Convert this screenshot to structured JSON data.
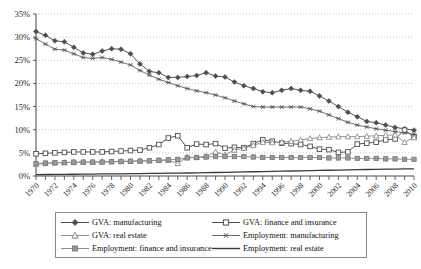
{
  "chart_data": {
    "type": "line",
    "title": "",
    "xlabel": "",
    "ylabel": "",
    "ylim": [
      0,
      35
    ],
    "yticks": [
      "0%",
      "5%",
      "10%",
      "15%",
      "20%",
      "25%",
      "30%",
      "35%"
    ],
    "ytick_values": [
      0,
      5,
      10,
      15,
      20,
      25,
      30,
      35
    ],
    "grid": true,
    "grid_style": "dotted horizontal",
    "legend_position": "bottom",
    "legend_columns": 2,
    "x": [
      1970,
      1971,
      1972,
      1973,
      1974,
      1975,
      1976,
      1977,
      1978,
      1979,
      1980,
      1981,
      1982,
      1983,
      1984,
      1985,
      1986,
      1987,
      1988,
      1989,
      1990,
      1991,
      1992,
      1993,
      1994,
      1995,
      1996,
      1997,
      1998,
      1999,
      2000,
      2001,
      2002,
      2003,
      2004,
      2005,
      2006,
      2007,
      2008,
      2009,
      2010
    ],
    "xtick_labels": [
      "1970",
      "1972",
      "1974",
      "1976",
      "1978",
      "1980",
      "1982",
      "1984",
      "1986",
      "1988",
      "1990",
      "1992",
      "1994",
      "1996",
      "1998",
      "2000",
      "2002",
      "2004",
      "2006",
      "2008",
      "2010"
    ],
    "xlim": [
      1970,
      2010
    ],
    "series": [
      {
        "name": "GVA: manufacturing",
        "marker": "filled-diamond",
        "color": "#4d4d4d",
        "values": [
          31.2,
          30.4,
          29.2,
          29.0,
          27.8,
          26.6,
          26.3,
          27.0,
          27.5,
          27.4,
          26.4,
          24.2,
          22.6,
          22.3,
          21.3,
          21.3,
          21.5,
          21.7,
          22.3,
          21.6,
          21.4,
          20.3,
          19.5,
          18.9,
          18.2,
          18.0,
          18.5,
          18.9,
          18.5,
          18.3,
          17.3,
          16.2,
          15.0,
          13.8,
          12.8,
          11.8,
          11.5,
          11.0,
          10.5,
          10.2,
          9.9
        ]
      },
      {
        "name": "GVA: finance and insurance",
        "marker": "open-square",
        "color": "#4d4d4d",
        "values": [
          4.8,
          4.9,
          5.0,
          5.1,
          5.2,
          5.2,
          5.2,
          5.2,
          5.3,
          5.4,
          5.5,
          5.6,
          6.1,
          6.8,
          8.2,
          8.7,
          6.1,
          6.9,
          6.8,
          7.0,
          6.0,
          6.2,
          6.1,
          7.0,
          7.8,
          7.5,
          7.1,
          7.0,
          6.8,
          6.4,
          5.8,
          5.7,
          5.1,
          5.2,
          6.9,
          7.1,
          7.3,
          7.8,
          8.0,
          9.9,
          8.5
        ]
      },
      {
        "name": "GVA: real estate",
        "marker": "open-triangle",
        "color": "#8c8c8c",
        "values": [
          2.5,
          2.7,
          2.8,
          2.9,
          2.9,
          3.0,
          3.0,
          3.1,
          3.1,
          3.2,
          3.2,
          3.3,
          3.3,
          3.4,
          3.4,
          2.7,
          4.1,
          4.0,
          4.3,
          5.2,
          4.6,
          5.6,
          6.0,
          6.6,
          7.3,
          7.2,
          7.3,
          7.5,
          7.8,
          8.1,
          8.3,
          8.4,
          8.5,
          8.5,
          8.5,
          8.6,
          8.7,
          8.8,
          8.9,
          7.3,
          8.3
        ]
      },
      {
        "name": "Employment: manufacturing",
        "marker": "asterisk",
        "color": "#6b6b6b",
        "values": [
          29.7,
          28.5,
          27.4,
          27.2,
          26.4,
          25.6,
          25.4,
          25.6,
          25.2,
          24.6,
          24.0,
          22.8,
          21.8,
          20.9,
          20.2,
          19.5,
          18.9,
          18.4,
          18.0,
          17.5,
          16.9,
          16.2,
          15.6,
          15.0,
          14.9,
          14.9,
          14.9,
          14.9,
          14.9,
          14.5,
          14.0,
          13.2,
          12.4,
          11.6,
          11.0,
          10.6,
          10.2,
          9.9,
          9.6,
          9.3,
          9.0
        ]
      },
      {
        "name": "Employment: finance and insurance",
        "marker": "filled-square",
        "color": "#8c8c8c",
        "values": [
          2.7,
          2.8,
          2.9,
          2.9,
          3.0,
          3.0,
          3.0,
          3.0,
          3.1,
          3.1,
          3.2,
          3.2,
          3.3,
          3.4,
          3.5,
          3.6,
          3.9,
          4.0,
          4.1,
          4.2,
          4.2,
          4.2,
          4.2,
          4.1,
          4.0,
          4.0,
          4.0,
          4.0,
          4.0,
          4.0,
          4.0,
          3.9,
          3.9,
          3.9,
          3.8,
          3.8,
          3.8,
          3.7,
          3.7,
          3.6,
          3.6
        ]
      },
      {
        "name": "Employment: real estate",
        "marker": "none",
        "color": "#3a3a3a",
        "values": [
          0.3,
          0.32,
          0.34,
          0.36,
          0.38,
          0.4,
          0.42,
          0.44,
          0.46,
          0.48,
          0.5,
          0.52,
          0.55,
          0.58,
          0.6,
          0.62,
          0.65,
          0.68,
          0.72,
          0.76,
          0.8,
          0.84,
          0.88,
          0.92,
          0.96,
          1.0,
          1.04,
          1.08,
          1.12,
          1.16,
          1.2,
          1.24,
          1.28,
          1.32,
          1.36,
          1.4,
          1.44,
          1.47,
          1.5,
          1.52,
          1.55
        ]
      }
    ]
  },
  "legend": {
    "items": [
      {
        "label": "GVA: manufacturing",
        "marker": "filled-diamond",
        "color": "#4d4d4d"
      },
      {
        "label": "GVA: finance and insurance",
        "marker": "open-square",
        "color": "#4d4d4d"
      },
      {
        "label": "GVA: real estate",
        "marker": "open-triangle",
        "color": "#8c8c8c"
      },
      {
        "label": "Employment: manufacturing",
        "marker": "asterisk",
        "color": "#6b6b6b"
      },
      {
        "label": "Employment: finance and insurance",
        "marker": "filled-square",
        "color": "#8c8c8c"
      },
      {
        "label": "Employment: real estate",
        "marker": "none",
        "color": "#3a3a3a"
      }
    ]
  }
}
